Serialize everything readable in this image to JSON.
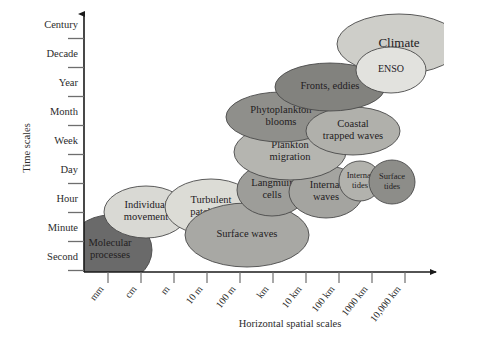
{
  "figure": {
    "background": "#ffffff",
    "y_axis_title": "Time scales",
    "x_axis_title": "Horizontal spatial scales"
  },
  "chart_data": {
    "type": "scatter",
    "title": "",
    "xlabel": "Horizontal spatial scales",
    "ylabel": "Time scales",
    "grid": false,
    "legend": "none",
    "x_tick_labels": [
      "mm",
      "cm",
      "m",
      "10 m",
      "100 m",
      "km",
      "10 km",
      "100 km",
      "1000 km",
      "10,000 km"
    ],
    "y_tick_labels": [
      "Second",
      "Minute",
      "Hour",
      "Day",
      "Week",
      "Month",
      "Year",
      "Decade",
      "Century"
    ],
    "x_tick_px": [
      108,
      141,
      174,
      207,
      240,
      273,
      306,
      339,
      372,
      405
    ],
    "y_tick_px": [
      256,
      227,
      198,
      169,
      140,
      111,
      82,
      53,
      24
    ],
    "bubbles": [
      {
        "label": "Molecular processes",
        "lines": [
          "Molecular",
          "processes"
        ],
        "cx": 110,
        "cy": 250,
        "rx": 42,
        "ry": 35,
        "rotate": 0,
        "fill": "#6a6a6a",
        "font_size": 10.5,
        "clipped": true
      },
      {
        "label": "Individual movement",
        "lines": [
          "Individual",
          "movement"
        ],
        "cx": 146,
        "cy": 212,
        "rx": 42,
        "ry": 26,
        "rotate": 0,
        "fill": "#d9d9d4",
        "font_size": 10.5,
        "clipped": false
      },
      {
        "label": "Turbulent patch size",
        "lines": [
          "Turbulent",
          "patch size"
        ],
        "cx": 211,
        "cy": 207,
        "rx": 46,
        "ry": 28,
        "rotate": 0,
        "fill": "#dcdcd6",
        "font_size": 10.5,
        "clipped": false
      },
      {
        "label": "Surface waves",
        "lines": [
          "Surface waves"
        ],
        "cx": 247,
        "cy": 235,
        "rx": 62,
        "ry": 32,
        "rotate": 0,
        "fill": "#a8a8a4",
        "font_size": 10.5,
        "clipped": false
      },
      {
        "label": "Langmuir cells",
        "lines": [
          "Langmuir",
          "cells"
        ],
        "cx": 272,
        "cy": 190,
        "rx": 35,
        "ry": 26,
        "rotate": 0,
        "fill": "#9d9d99",
        "font_size": 10.5,
        "clipped": false
      },
      {
        "label": "Internal waves",
        "lines": [
          "Internal",
          "waves"
        ],
        "cx": 326,
        "cy": 192,
        "rx": 37,
        "ry": 26,
        "rotate": 0,
        "fill": "#a4a4a0",
        "font_size": 10.5,
        "clipped": false
      },
      {
        "label": "Internal tides",
        "lines": [
          "Internal",
          "tides"
        ],
        "cx": 360,
        "cy": 181,
        "rx": 21,
        "ry": 20,
        "rotate": 0,
        "fill": "#b2b2ad",
        "font_size": 8.5,
        "clipped": false
      },
      {
        "label": "Surface tides",
        "lines": [
          "Surface",
          "tides"
        ],
        "cx": 392,
        "cy": 182,
        "rx": 23,
        "ry": 22,
        "rotate": 0,
        "fill": "#8d8d89",
        "font_size": 8.5,
        "clipped": false
      },
      {
        "label": "Plankton migration",
        "lines": [
          "Plankton",
          "migration"
        ],
        "cx": 290,
        "cy": 152,
        "rx": 56,
        "ry": 28,
        "rotate": 0,
        "fill": "#b5b5b0",
        "font_size": 10.5,
        "clipped": false
      },
      {
        "label": "Phytoplankton blooms",
        "lines": [
          "Phytoplankton",
          "blooms"
        ],
        "cx": 281,
        "cy": 117,
        "rx": 55,
        "ry": 25,
        "rotate": 0,
        "fill": "#8f8f8b",
        "font_size": 10.5,
        "clipped": false
      },
      {
        "label": "Coastal trapped waves",
        "lines": [
          "Coastal",
          "trapped waves"
        ],
        "cx": 353,
        "cy": 131,
        "rx": 47,
        "ry": 24,
        "rotate": 0,
        "fill": "#b0b0ab",
        "font_size": 10.5,
        "clipped": false
      },
      {
        "label": "Fronts, eddies",
        "lines": [
          "Fronts, eddies"
        ],
        "cx": 330,
        "cy": 87,
        "rx": 55,
        "ry": 24,
        "rotate": 0,
        "fill": "#82827e",
        "font_size": 10.5,
        "clipped": false
      },
      {
        "label": "Climate",
        "lines": [
          "Climate"
        ],
        "cx": 399,
        "cy": 44,
        "rx": 62,
        "ry": 30,
        "rotate": 0,
        "fill": "#cecec9",
        "font_size": 13,
        "clipped": false
      },
      {
        "label": "ENSO",
        "lines": [
          "ENSO"
        ],
        "cx": 391,
        "cy": 70,
        "rx": 35,
        "ry": 23,
        "rotate": 0,
        "fill": "#e2e2de",
        "font_size": 10,
        "clipped": false
      }
    ]
  }
}
